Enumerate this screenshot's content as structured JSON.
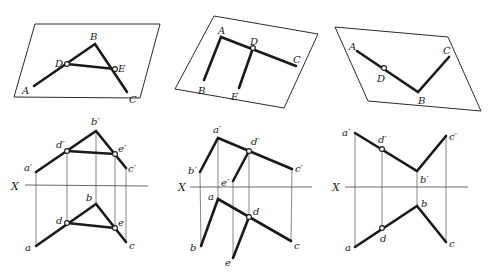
{
  "figures": [
    {
      "id": "fig1",
      "spatial": {
        "plane": [
          [
            35,
            24
          ],
          [
            160,
            24
          ],
          [
            140,
            98
          ],
          [
            14,
            97
          ]
        ],
        "points": {
          "A": [
            34,
            86
          ],
          "B": [
            95,
            44
          ],
          "C": [
            127,
            92
          ],
          "D": [
            67,
            64
          ],
          "E": [
            115,
            69
          ]
        },
        "labels": {
          "A": "A",
          "B": "B",
          "C": "C",
          "D": "D",
          "E": "E"
        },
        "label_pos": {
          "A": [
            22,
            94
          ],
          "B": [
            90,
            40
          ],
          "C": [
            129,
            103
          ],
          "D": [
            55,
            67
          ],
          "E": [
            118,
            72
          ]
        }
      },
      "projection": {
        "axis_label": "X",
        "axis": [
          [
            25,
            185
          ],
          [
            148,
            186
          ]
        ],
        "front": {
          "a'": [
            36,
            172
          ],
          "b'": [
            96,
            131
          ],
          "c'": [
            126,
            168
          ],
          "d'": [
            67,
            151
          ],
          "e'": [
            115,
            154
          ]
        },
        "top": {
          "a": [
            36,
            246
          ],
          "b": [
            96,
            204
          ],
          "c": [
            126,
            242
          ],
          "d": [
            67,
            223
          ],
          "e": [
            115,
            228
          ]
        },
        "labels": {
          "a'": "a′",
          "b'": "b′",
          "c'": "c′",
          "d'": "d′",
          "e'": "e′",
          "a": "a",
          "b": "b",
          "c": "c",
          "d": "d",
          "e": "e"
        },
        "label_pos": {
          "a'": [
            26,
            171
          ],
          "b'": [
            92,
            124
          ],
          "c'": [
            128,
            172
          ],
          "d'": [
            57,
            147
          ],
          "e'": [
            118,
            152
          ],
          "a": [
            25,
            251
          ],
          "b": [
            86,
            201
          ],
          "c": [
            129,
            248
          ],
          "d": [
            56,
            223
          ],
          "e": [
            118,
            225
          ]
        }
      }
    },
    {
      "id": "fig2",
      "spatial": {
        "plane": [
          [
            214,
            16
          ],
          [
            318,
            34
          ],
          [
            284,
            108
          ],
          [
            175,
            89
          ]
        ],
        "points": {
          "A": [
            221,
            37
          ],
          "B": [
            204,
            80
          ],
          "C": [
            296,
            66
          ],
          "D": [
            253,
            48
          ],
          "E": [
            239,
            88
          ]
        },
        "labels": {
          "A": "A",
          "B": "B",
          "C": "C",
          "D": "D",
          "E": "E"
        },
        "label_pos": {
          "A": [
            219,
            34
          ],
          "B": [
            198,
            94
          ],
          "C": [
            292,
            63
          ],
          "D": [
            251,
            45
          ],
          "E": [
            231,
            100
          ]
        }
      },
      "projection": {
        "axis_label": "X",
        "axis": [
          [
            190,
            187
          ],
          [
            312,
            187
          ]
        ],
        "front": {
          "a'": [
            218,
            138
          ],
          "b'": [
            200,
            172
          ],
          "c'": [
            292,
            169
          ],
          "d'": [
            249,
            151
          ],
          "e'": [
            233,
            181
          ]
        },
        "top": {
          "a": [
            218,
            199
          ],
          "b": [
            201,
            246
          ],
          "c": [
            291,
            241
          ],
          "d": [
            249,
            217
          ],
          "e": [
            233,
            258
          ]
        },
        "labels": {
          "a'": "a′",
          "b'": "b′",
          "c'": "c′",
          "d'": "d′",
          "e'": "e′",
          "a": "a",
          "b": "b",
          "c": "c",
          "d": "d",
          "e": "e"
        },
        "label_pos": {
          "a'": [
            214,
            133
          ],
          "b'": [
            189,
            173
          ],
          "c'": [
            295,
            171
          ],
          "d'": [
            251,
            144
          ],
          "e'": [
            222,
            185
          ],
          "a": [
            208,
            200
          ],
          "b": [
            190,
            251
          ],
          "c": [
            294,
            249
          ],
          "d": [
            253,
            215
          ],
          "e": [
            226,
            266
          ]
        }
      }
    },
    {
      "id": "fig3",
      "spatial": {
        "plane": [
          [
            335,
            27
          ],
          [
            448,
            37
          ],
          [
            481,
            111
          ],
          [
            368,
            101
          ]
        ],
        "points": {
          "A": [
            357,
            51
          ],
          "B": [
            418,
            92
          ],
          "C": [
            449,
            57
          ],
          "D": [
            384,
            68
          ]
        },
        "labels": {
          "A": "A",
          "B": "B",
          "C": "C",
          "D": "D"
        },
        "label_pos": {
          "A": [
            349,
            50
          ],
          "B": [
            418,
            104
          ],
          "C": [
            443,
            54
          ],
          "D": [
            377,
            82
          ]
        }
      },
      "projection": {
        "axis_label": "X",
        "axis": [
          [
            345,
            187
          ],
          [
            468,
            187
          ]
        ],
        "front": {
          "a'": [
            355,
            133
          ],
          "b'": [
            417,
            171
          ],
          "c'": [
            446,
            136
          ],
          "d'": [
            382,
            149
          ]
        },
        "top": {
          "a": [
            355,
            247
          ],
          "b": [
            417,
            206
          ],
          "c": [
            446,
            242
          ],
          "d": [
            382,
            228
          ]
        },
        "labels": {
          "a'": "a′",
          "b'": "b′",
          "c'": "c′",
          "d'": "d′",
          "a": "a",
          "b": "b",
          "c": "c",
          "d": "d"
        },
        "label_pos": {
          "a'": [
            343,
            135
          ],
          "b'": [
            420,
            182
          ],
          "c'": [
            449,
            139
          ],
          "d'": [
            378,
            143
          ],
          "a": [
            345,
            250
          ],
          "b": [
            421,
            206
          ],
          "c": [
            449,
            246
          ],
          "d": [
            381,
            242
          ]
        }
      }
    }
  ],
  "axis_labels": {
    "fig1": "X",
    "fig2": "X",
    "fig3": "X"
  }
}
